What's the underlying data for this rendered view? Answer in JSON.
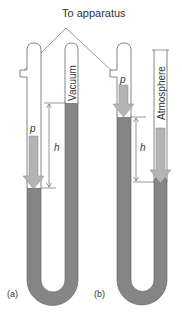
{
  "title": "To apparatus",
  "panels": {
    "a": {
      "label": "(a)",
      "pressure_label": "p",
      "height_label": "h",
      "closed_tube_label": "Vacuum"
    },
    "b": {
      "label": "(b)",
      "pressure_label": "p",
      "height_label": "h",
      "open_tube_label": "Atmosphere"
    }
  },
  "colors": {
    "mercury": "#858585",
    "arrow": "#b4b4b4",
    "outline": "#555555",
    "text": "#333333"
  }
}
